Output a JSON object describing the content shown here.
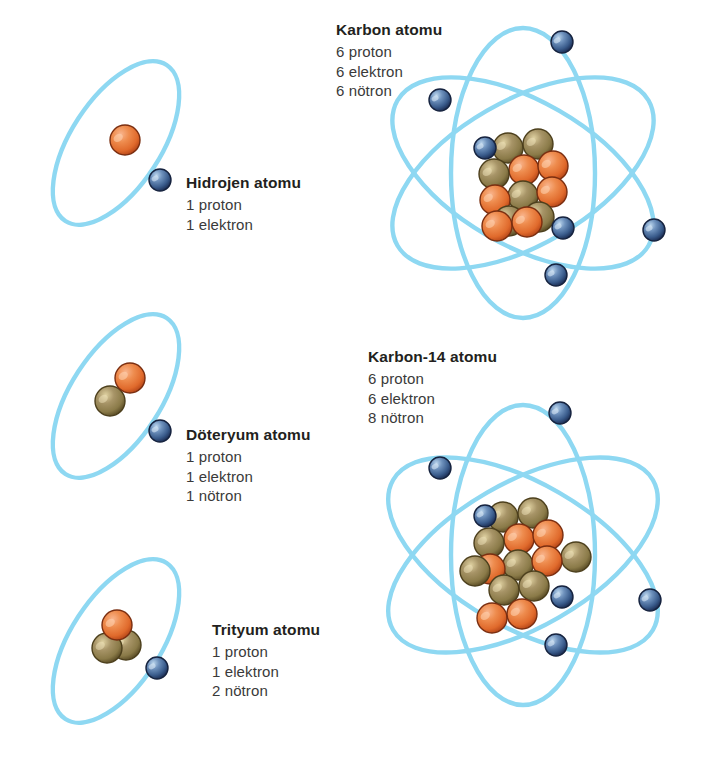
{
  "figure": {
    "background_color": "#ffffff",
    "orbit_color": "#8ed8f2",
    "proton_color": "#e8733a",
    "neutron_color": "#8a7a48",
    "electron_color": "#3a5c8c"
  },
  "legend_terms": {
    "proton": "proton",
    "electron": "elektron",
    "neutron": "nötron"
  },
  "atoms": [
    {
      "id": "hydrogen",
      "title": "Hidrojen atomu",
      "lines": [
        "1 proton",
        "1 elektron"
      ],
      "protons": 1,
      "neutrons": 0,
      "electrons": 1,
      "orbit_count": 1
    },
    {
      "id": "deuterium",
      "title": "Döteryum atomu",
      "lines": [
        "1 proton",
        "1 elektron",
        "1 nötron"
      ],
      "protons": 1,
      "neutrons": 1,
      "electrons": 1,
      "orbit_count": 1
    },
    {
      "id": "tritium",
      "title": "Trityum atomu",
      "lines": [
        "1 proton",
        "1 elektron",
        "2 nötron"
      ],
      "protons": 1,
      "neutrons": 2,
      "electrons": 1,
      "orbit_count": 1
    },
    {
      "id": "carbon",
      "title": "Karbon atomu",
      "lines": [
        "6 proton",
        "6 elektron",
        "6 nötron"
      ],
      "protons": 6,
      "neutrons": 6,
      "electrons": 6,
      "orbit_count": 3
    },
    {
      "id": "carbon14",
      "title": "Karbon-14 atomu",
      "lines": [
        "6 proton",
        "6 elektron",
        "8 nötron"
      ],
      "protons": 6,
      "neutrons": 8,
      "electrons": 6,
      "orbit_count": 3
    }
  ]
}
